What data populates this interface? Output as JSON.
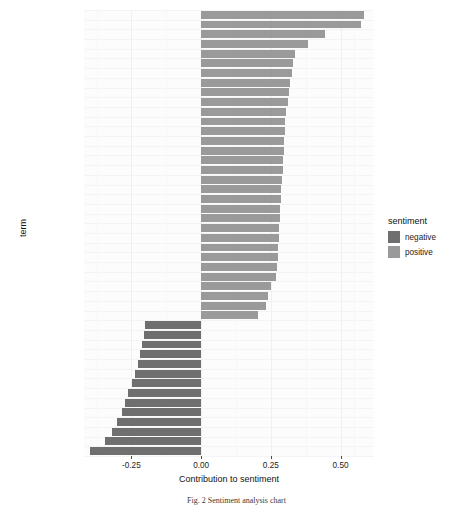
{
  "chart_data": {
    "type": "bar",
    "orientation": "horizontal",
    "title": "",
    "xlabel": "Contribution to sentiment",
    "ylabel": "term",
    "xlim": [
      -0.42,
      0.62
    ],
    "xticks": [
      -0.25,
      0.0,
      0.25,
      0.5
    ],
    "xtick_labels": [
      "-0.25",
      "0.00",
      "0.25",
      "0.50"
    ],
    "grid": true,
    "legend": {
      "title": "sentiment",
      "position": "right",
      "entries": [
        {
          "label": "negative",
          "color": "#6f6f6f"
        },
        {
          "label": "positive",
          "color": "#9a9a9a"
        }
      ]
    },
    "categories": [
      "capability",
      "patient",
      "award",
      "sustainable",
      "flexible",
      "talent",
      "master",
      "skill",
      "trust",
      "guidance",
      "foresight",
      "luxury",
      "agile",
      "competitive",
      "great",
      "innovative",
      "efficient",
      "intelligence",
      "integrated",
      "protection",
      "creative",
      "support",
      "important",
      "merit",
      "benefit",
      "solidarity",
      "success",
      "advantage",
      "rapid",
      "wellbeing",
      "dynamic",
      "successful",
      "complex",
      "fatigue",
      "lack",
      "limit",
      "error",
      "disruption",
      "conflict",
      "problem",
      "critical",
      "absence",
      "issue",
      "waste",
      "disruptive",
      "risk"
    ],
    "values": [
      0.585,
      0.575,
      0.445,
      0.385,
      0.335,
      0.33,
      0.325,
      0.32,
      0.315,
      0.31,
      0.305,
      0.302,
      0.3,
      0.298,
      0.296,
      0.294,
      0.292,
      0.29,
      0.288,
      0.286,
      0.284,
      0.282,
      0.28,
      0.278,
      0.276,
      0.274,
      0.272,
      0.27,
      0.252,
      0.24,
      0.232,
      0.205,
      -0.2,
      -0.205,
      -0.212,
      -0.22,
      -0.228,
      -0.238,
      -0.248,
      -0.262,
      -0.272,
      -0.284,
      -0.3,
      -0.32,
      -0.345,
      -0.4
    ],
    "sentiments": [
      "positive",
      "positive",
      "positive",
      "positive",
      "positive",
      "positive",
      "positive",
      "positive",
      "positive",
      "positive",
      "positive",
      "positive",
      "positive",
      "positive",
      "positive",
      "positive",
      "positive",
      "positive",
      "positive",
      "positive",
      "positive",
      "positive",
      "positive",
      "positive",
      "positive",
      "positive",
      "positive",
      "positive",
      "positive",
      "positive",
      "positive",
      "positive",
      "negative",
      "negative",
      "negative",
      "negative",
      "negative",
      "negative",
      "negative",
      "negative",
      "negative",
      "negative",
      "negative",
      "negative",
      "negative",
      "negative"
    ]
  },
  "caption": "Fig. 2   Sentiment analysis chart"
}
